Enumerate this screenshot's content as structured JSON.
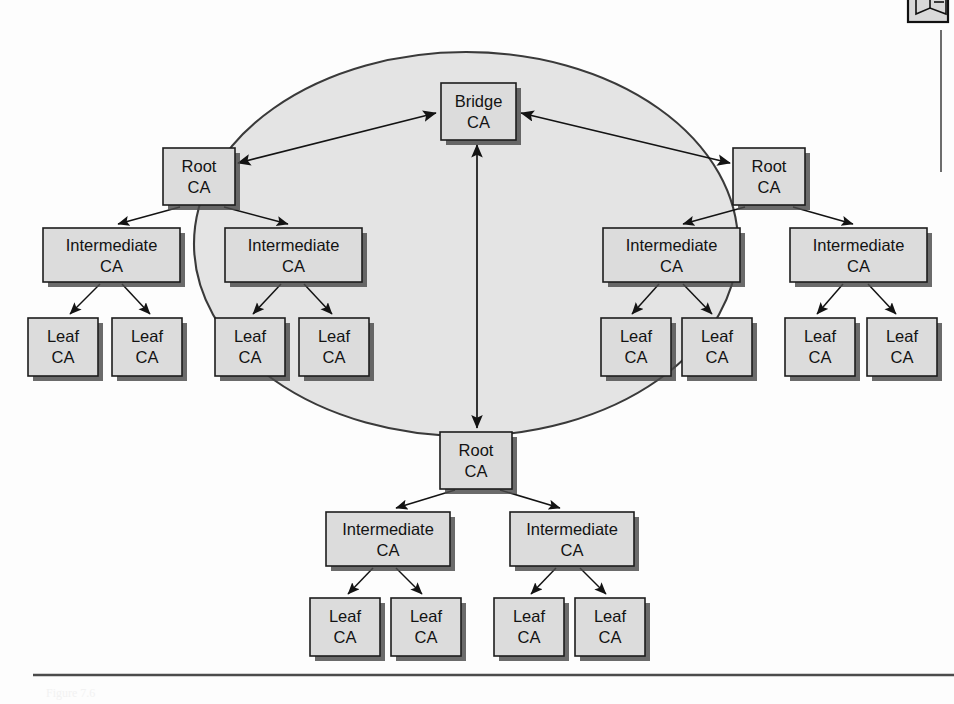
{
  "figure": {
    "caption_ghost": "Figure 7.6",
    "background_color": "#fdfdfd",
    "ellipse_fill": "#e4e4e4",
    "box_fill": "#dcdcdc",
    "line_color": "#131313"
  },
  "labels": {
    "bridge": "Bridge",
    "root": "Root",
    "intermediate": "Intermediate",
    "leaf": "Leaf",
    "ca": "CA"
  },
  "nodes": [
    {
      "id": "bridge-ca",
      "type": "bridge",
      "line1": "Bridge",
      "line2": "CA",
      "x": 441,
      "y": 83,
      "w": 75,
      "h": 57,
      "inside_ellipse": true
    },
    {
      "id": "root-ca-left",
      "type": "root",
      "line1": "Root",
      "line2": "CA",
      "x": 163,
      "y": 148,
      "w": 72,
      "h": 57,
      "inside_ellipse": true
    },
    {
      "id": "root-ca-right",
      "type": "root",
      "line1": "Root",
      "line2": "CA",
      "x": 733,
      "y": 148,
      "w": 72,
      "h": 57,
      "inside_ellipse": true
    },
    {
      "id": "root-ca-bottom",
      "type": "root",
      "line1": "Root",
      "line2": "CA",
      "x": 440,
      "y": 432,
      "w": 72,
      "h": 57,
      "inside_ellipse": true
    },
    {
      "id": "intermediate-ca-1",
      "type": "intermediate",
      "line1": "Intermediate",
      "line2": "CA",
      "x": 43,
      "y": 228,
      "w": 137,
      "h": 54,
      "inside_ellipse": false
    },
    {
      "id": "intermediate-ca-2",
      "type": "intermediate",
      "line1": "Intermediate",
      "line2": "CA",
      "x": 225,
      "y": 228,
      "w": 137,
      "h": 54,
      "inside_ellipse": true
    },
    {
      "id": "intermediate-ca-3",
      "type": "intermediate",
      "line1": "Intermediate",
      "line2": "CA",
      "x": 603,
      "y": 228,
      "w": 137,
      "h": 54,
      "inside_ellipse": true
    },
    {
      "id": "intermediate-ca-4",
      "type": "intermediate",
      "line1": "Intermediate",
      "line2": "CA",
      "x": 790,
      "y": 228,
      "w": 137,
      "h": 54,
      "inside_ellipse": false
    },
    {
      "id": "intermediate-ca-5",
      "type": "intermediate",
      "line1": "Intermediate",
      "line2": "CA",
      "x": 326,
      "y": 512,
      "w": 124,
      "h": 54,
      "inside_ellipse": false
    },
    {
      "id": "intermediate-ca-6",
      "type": "intermediate",
      "line1": "Intermediate",
      "line2": "CA",
      "x": 510,
      "y": 512,
      "w": 124,
      "h": 54,
      "inside_ellipse": false
    },
    {
      "id": "leaf-ca-1",
      "type": "leaf",
      "line1": "Leaf",
      "line2": "CA",
      "x": 28,
      "y": 318,
      "w": 70,
      "h": 58,
      "inside_ellipse": false
    },
    {
      "id": "leaf-ca-2",
      "type": "leaf",
      "line1": "Leaf",
      "line2": "CA",
      "x": 112,
      "y": 318,
      "w": 70,
      "h": 58,
      "inside_ellipse": false
    },
    {
      "id": "leaf-ca-3",
      "type": "leaf",
      "line1": "Leaf",
      "line2": "CA",
      "x": 215,
      "y": 318,
      "w": 70,
      "h": 58,
      "inside_ellipse": true
    },
    {
      "id": "leaf-ca-4",
      "type": "leaf",
      "line1": "Leaf",
      "line2": "CA",
      "x": 299,
      "y": 318,
      "w": 70,
      "h": 58,
      "inside_ellipse": true
    },
    {
      "id": "leaf-ca-5",
      "type": "leaf",
      "line1": "Leaf",
      "line2": "CA",
      "x": 601,
      "y": 318,
      "w": 70,
      "h": 58,
      "inside_ellipse": true
    },
    {
      "id": "leaf-ca-6",
      "type": "leaf",
      "line1": "Leaf",
      "line2": "CA",
      "x": 682,
      "y": 318,
      "w": 70,
      "h": 58,
      "inside_ellipse": true
    },
    {
      "id": "leaf-ca-7",
      "type": "leaf",
      "line1": "Leaf",
      "line2": "CA",
      "x": 785,
      "y": 318,
      "w": 70,
      "h": 58,
      "inside_ellipse": false
    },
    {
      "id": "leaf-ca-8",
      "type": "leaf",
      "line1": "Leaf",
      "line2": "CA",
      "x": 867,
      "y": 318,
      "w": 70,
      "h": 58,
      "inside_ellipse": false
    },
    {
      "id": "leaf-ca-9",
      "type": "leaf",
      "line1": "Leaf",
      "line2": "CA",
      "x": 310,
      "y": 598,
      "w": 70,
      "h": 58,
      "inside_ellipse": false
    },
    {
      "id": "leaf-ca-10",
      "type": "leaf",
      "line1": "Leaf",
      "line2": "CA",
      "x": 391,
      "y": 598,
      "w": 70,
      "h": 58,
      "inside_ellipse": false
    },
    {
      "id": "leaf-ca-11",
      "type": "leaf",
      "line1": "Leaf",
      "line2": "CA",
      "x": 494,
      "y": 598,
      "w": 70,
      "h": 58,
      "inside_ellipse": false
    },
    {
      "id": "leaf-ca-12",
      "type": "leaf",
      "line1": "Leaf",
      "line2": "CA",
      "x": 575,
      "y": 598,
      "w": 70,
      "h": 58,
      "inside_ellipse": false
    }
  ],
  "edges": [
    {
      "id": "edge-bridge-rootleft",
      "from": "root-ca-left",
      "to": "bridge-ca",
      "style": "bidirectional"
    },
    {
      "id": "edge-bridge-rootright",
      "from": "root-ca-right",
      "to": "bridge-ca",
      "style": "bidirectional"
    },
    {
      "id": "edge-bridge-rootbottom",
      "from": "root-ca-bottom",
      "to": "bridge-ca",
      "style": "bidirectional"
    },
    {
      "id": "edge-rootleft-int1",
      "from": "root-ca-left",
      "to": "intermediate-ca-1",
      "style": "arrow"
    },
    {
      "id": "edge-rootleft-int2",
      "from": "root-ca-left",
      "to": "intermediate-ca-2",
      "style": "arrow"
    },
    {
      "id": "edge-rootright-int3",
      "from": "root-ca-right",
      "to": "intermediate-ca-3",
      "style": "arrow"
    },
    {
      "id": "edge-rootright-int4",
      "from": "root-ca-right",
      "to": "intermediate-ca-4",
      "style": "arrow"
    },
    {
      "id": "edge-rootbottom-int5",
      "from": "root-ca-bottom",
      "to": "intermediate-ca-5",
      "style": "arrow"
    },
    {
      "id": "edge-rootbottom-int6",
      "from": "root-ca-bottom",
      "to": "intermediate-ca-6",
      "style": "arrow"
    },
    {
      "id": "edge-int1-leaf1",
      "from": "intermediate-ca-1",
      "to": "leaf-ca-1",
      "style": "arrow"
    },
    {
      "id": "edge-int1-leaf2",
      "from": "intermediate-ca-1",
      "to": "leaf-ca-2",
      "style": "arrow"
    },
    {
      "id": "edge-int2-leaf3",
      "from": "intermediate-ca-2",
      "to": "leaf-ca-3",
      "style": "arrow"
    },
    {
      "id": "edge-int2-leaf4",
      "from": "intermediate-ca-2",
      "to": "leaf-ca-4",
      "style": "arrow"
    },
    {
      "id": "edge-int3-leaf5",
      "from": "intermediate-ca-3",
      "to": "leaf-ca-5",
      "style": "arrow"
    },
    {
      "id": "edge-int3-leaf6",
      "from": "intermediate-ca-3",
      "to": "leaf-ca-6",
      "style": "arrow"
    },
    {
      "id": "edge-int4-leaf7",
      "from": "intermediate-ca-4",
      "to": "leaf-ca-7",
      "style": "arrow"
    },
    {
      "id": "edge-int4-leaf8",
      "from": "intermediate-ca-4",
      "to": "leaf-ca-8",
      "style": "arrow"
    },
    {
      "id": "edge-int5-leaf9",
      "from": "intermediate-ca-5",
      "to": "leaf-ca-9",
      "style": "arrow"
    },
    {
      "id": "edge-int5-leaf10",
      "from": "intermediate-ca-5",
      "to": "leaf-ca-10",
      "style": "arrow"
    },
    {
      "id": "edge-int6-leaf11",
      "from": "intermediate-ca-6",
      "to": "leaf-ca-11",
      "style": "arrow"
    },
    {
      "id": "edge-int6-leaf12",
      "from": "intermediate-ca-6",
      "to": "leaf-ca-12",
      "style": "arrow"
    }
  ],
  "trust_ellipse": {
    "cx": 466,
    "cy": 244,
    "rx": 272,
    "ry": 192
  },
  "corner_icon": {
    "name": "note-book-icon"
  }
}
